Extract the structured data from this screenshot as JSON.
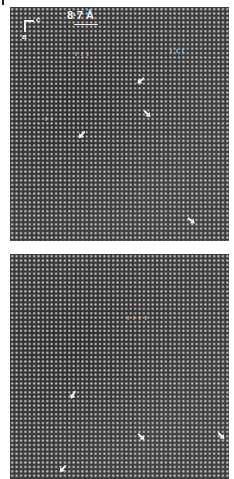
{
  "figure": {
    "panels": [
      {
        "id": "top",
        "scale_label": "8·7 Å",
        "axes": {
          "horizontal": "c",
          "vertical": "a"
        },
        "arrow_count": 5,
        "tick_marks": [
          "ı ı ı",
          "ı ı ı",
          "ı ı"
        ]
      },
      {
        "id": "bottom",
        "arrow_count": 4,
        "tick_marks": [
          "ı ı ı ı"
        ]
      }
    ],
    "colors": {
      "background": "#3b3b3b",
      "lattice_dot": "#d7d7d7",
      "annotation": "#f0f0f0"
    }
  }
}
